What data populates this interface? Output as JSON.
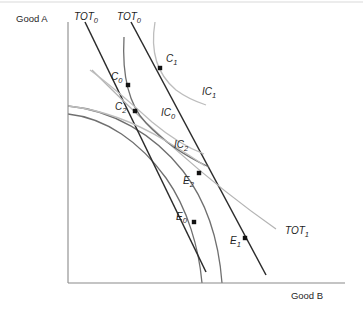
{
  "figure": {
    "kind": "indifference-curve-trade-diagram",
    "axes": {
      "y_label": "Good A",
      "x_label": "Good B",
      "origin": [
        68,
        283
      ],
      "x_axis_end": [
        345,
        283
      ],
      "y_axis_top": [
        68,
        22
      ]
    },
    "colors": {
      "axis": "#8a8a8a",
      "tot_dark": "#2b2b2b",
      "tot_light": "#b4b4b4",
      "ppf": "#6f6f6f",
      "ic_light": "#bdbdbd",
      "ic_dark": "#6f6f6f",
      "point": "#121212",
      "text": "#1f1f1f",
      "background": "#ffffff"
    }
  },
  "chart_data": {
    "type": "line",
    "title": "",
    "xlabel": "Good B",
    "ylabel": "Good A",
    "grid": false,
    "legend": "none",
    "curve_labels": [
      {
        "id": "tot0-left",
        "base": "TOT",
        "sub": "0",
        "x": 74,
        "y": 20
      },
      {
        "id": "tot0-right",
        "base": "TOT",
        "sub": "0",
        "x": 117,
        "y": 20
      },
      {
        "id": "tot1",
        "base": "TOT",
        "sub": "1",
        "x": 285,
        "y": 234
      },
      {
        "id": "ic0",
        "base": "IC",
        "sub": "0",
        "x": 161,
        "y": 116
      },
      {
        "id": "ic1",
        "base": "IC",
        "sub": "1",
        "x": 202,
        "y": 95
      },
      {
        "id": "ic2",
        "base": "IC",
        "sub": "2",
        "x": 174,
        "y": 148
      }
    ],
    "points": [
      {
        "id": "C0",
        "base": "C",
        "sub": "0",
        "cx": 128,
        "cy": 85,
        "lx": 111,
        "ly": 80
      },
      {
        "id": "C1",
        "base": "C",
        "sub": "1",
        "cx": 160,
        "cy": 68,
        "lx": 166,
        "ly": 62
      },
      {
        "id": "C2",
        "base": "C",
        "sub": "2",
        "cx": 135,
        "cy": 111,
        "lx": 115,
        "ly": 110
      },
      {
        "id": "E2",
        "base": "E",
        "sub": "2",
        "cx": 199,
        "cy": 173,
        "lx": 183,
        "ly": 184
      },
      {
        "id": "E0",
        "base": "E",
        "sub": "0",
        "cx": 194,
        "cy": 222,
        "lx": 176,
        "ly": 220
      },
      {
        "id": "E1",
        "base": "E",
        "sub": "1",
        "cx": 245,
        "cy": 238,
        "lx": 230,
        "ly": 244
      }
    ],
    "series": [
      {
        "name": "PPF-outer",
        "role": "production-possibility-frontier",
        "style": "ppf",
        "path": "M 68,106 C 112,110 154,134 183,171 C 207,202 219,243 222,283"
      },
      {
        "name": "PPF-inner",
        "role": "production-possibility-frontier",
        "style": "ppf",
        "path": "M 68,114 C 106,118 140,142 166,178 C 188,209 199,249 202,283"
      },
      {
        "name": "TOT0-left",
        "role": "terms-of-trade-line",
        "style": "tot-dark",
        "path": "M 85,22 L 206,272"
      },
      {
        "name": "TOT0-right",
        "role": "terms-of-trade-line",
        "style": "tot-dark",
        "path": "M 131,22 L 266,275"
      },
      {
        "name": "TOT1",
        "role": "terms-of-trade-line",
        "style": "tot-light",
        "path": "M 92,70 C 140,118 200,176 276,229"
      },
      {
        "name": "IC0",
        "role": "indifference-curve",
        "style": "ic-dark",
        "path": "M 124,37 C 122,74 128,104 146,123 C 163,141 185,156 209,167"
      },
      {
        "name": "IC1",
        "role": "indifference-curve",
        "style": "ic-light",
        "path": "M 155,22 C 150,52 158,75 176,90 C 188,99 200,103 206,105"
      },
      {
        "name": "IC2",
        "role": "indifference-curve",
        "style": "ic-light",
        "path": "M 90,70 C 112,86 132,104 152,122 C 170,137 188,148 204,154"
      },
      {
        "name": "IC2-lower",
        "role": "indifference-curve",
        "style": "ic-light",
        "path": "M 68,106 C 104,110 138,124 166,141 C 186,153 198,161 205,166"
      }
    ]
  }
}
